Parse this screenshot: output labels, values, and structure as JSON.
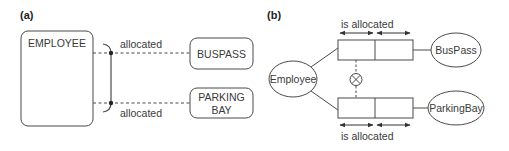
{
  "panels": {
    "a": {
      "label": "(a)",
      "entity_main": "EMPLOYEE",
      "entity_top": "BUSPASS",
      "entity_bottom_line1": "PARKING",
      "entity_bottom_line2": "BAY",
      "relation_top": "allocated",
      "relation_bottom": "allocated"
    },
    "b": {
      "label": "(b)",
      "entity_main": "Employee",
      "entity_top": "BusPass",
      "entity_bottom": "ParkingBay",
      "relation_top": "is allocated",
      "relation_bottom": "is allocated",
      "exclusion_symbol": "⊗"
    }
  },
  "colors": {
    "stroke": "#4a4a4a",
    "text": "#3a3a3a",
    "background": "#ffffff"
  }
}
